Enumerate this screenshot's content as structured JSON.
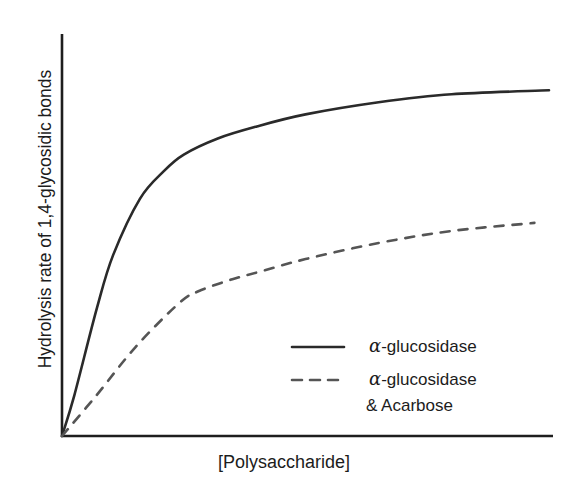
{
  "chart_data": {
    "type": "line",
    "title": "",
    "xlabel": "[Polysaccharide]",
    "ylabel": "Hydrolysis rate of 1,4-glycosidic bonds",
    "grid": false,
    "ticks": false,
    "legend_position": "lower right",
    "xlim": [
      0,
      10
    ],
    "ylim": [
      0,
      10
    ],
    "series": [
      {
        "name": "α-glucosidase",
        "style": "solid",
        "color": "#2a2a2a",
        "x": [
          0,
          0.25,
          0.72,
          1.05,
          1.6,
          2.1,
          2.5,
          3.2,
          4.0,
          5.0,
          6.5,
          8.0,
          10.0
        ],
        "y": [
          0,
          1.0,
          3.2,
          4.5,
          5.9,
          6.6,
          7.0,
          7.4,
          7.7,
          8.0,
          8.3,
          8.5,
          8.6
        ]
      },
      {
        "name": "α-glucosidase & Acarbose",
        "style": "dashed",
        "color": "#555555",
        "x": [
          0,
          0.7,
          1.5,
          2.4,
          2.8,
          3.5,
          4.1,
          5.0,
          6.5,
          8.0,
          9.7
        ],
        "y": [
          0,
          1.0,
          2.2,
          3.3,
          3.6,
          3.9,
          4.1,
          4.4,
          4.8,
          5.1,
          5.3
        ]
      }
    ]
  },
  "axes": {
    "xlabel": "[Polysaccharide]",
    "ylabel": "Hydrolysis rate of 1,4-glycosidic bonds"
  },
  "legend": {
    "entries": [
      {
        "alpha": "α",
        "text": "-glucosidase",
        "line2": ""
      },
      {
        "alpha": "α",
        "text": "-glucosidase",
        "line2": "& Acarbose"
      }
    ]
  }
}
